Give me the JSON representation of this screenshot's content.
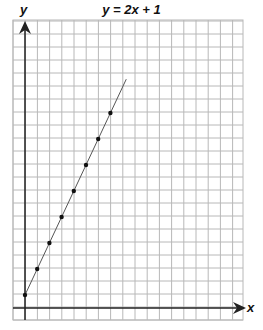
{
  "chart_data": {
    "type": "line",
    "title": "y = 2x + 1",
    "xlabel": "x",
    "ylabel": "y",
    "grid": true,
    "x": [
      0,
      1,
      2,
      3,
      4,
      5,
      6,
      7
    ],
    "series": [
      {
        "name": "y = 2x + 1",
        "values": [
          1,
          3,
          5,
          7,
          9,
          11,
          13,
          15
        ],
        "markers": true,
        "line_extends_to_x": 8.3
      }
    ],
    "xlim": [
      -1,
      17.8
    ],
    "ylim": [
      -1,
      22
    ],
    "legend": "none",
    "tick_labels": "none"
  },
  "colors": {
    "grid": "#b8b8b8",
    "axis": "#222222",
    "line": "#555555",
    "point": "#111111"
  }
}
